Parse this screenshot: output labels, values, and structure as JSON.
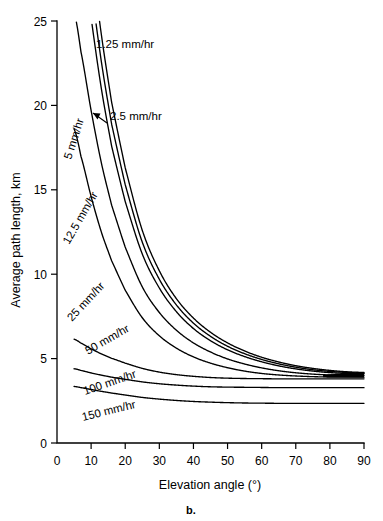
{
  "chart_data": {
    "type": "line",
    "title": "",
    "caption": "b.",
    "xlabel": "Elevation angle (°)",
    "ylabel": "Average path length, km",
    "xlim": [
      0,
      90
    ],
    "ylim": [
      0,
      25
    ],
    "xticks": [
      0,
      10,
      20,
      30,
      40,
      50,
      60,
      70,
      80,
      90
    ],
    "xticklabels": [
      "0",
      "10",
      "20",
      "30",
      "40",
      "50",
      "60",
      "70",
      "80",
      "90"
    ],
    "yticks": [
      0,
      5,
      10,
      15,
      20,
      25
    ],
    "yticklabels": [
      "0",
      "5",
      "10",
      "15",
      "20",
      "25"
    ],
    "grid": false,
    "legend_position": "inline-curve-labels",
    "x": [
      5,
      7,
      10,
      13,
      16,
      20,
      25,
      30,
      35,
      40,
      45,
      50,
      55,
      60,
      65,
      70,
      75,
      80,
      85,
      90
    ],
    "series": [
      {
        "name": "1.25 mm/hr",
        "label": "1.25 mm/hr",
        "label_rotation": 0,
        "values": [
          38.0,
          34.5,
          29.0,
          24.2,
          20.2,
          16.3,
          12.6,
          10.2,
          8.55,
          7.4,
          6.56,
          5.93,
          5.45,
          5.08,
          4.8,
          4.58,
          4.42,
          4.3,
          4.22,
          4.18
        ]
      },
      {
        "name": "2.5 mm/hr",
        "label": "2.5 mm/hr",
        "label_rotation": 0,
        "values": [
          35.5,
          32.2,
          27.1,
          22.6,
          18.9,
          15.3,
          11.9,
          9.7,
          8.18,
          7.1,
          6.32,
          5.73,
          5.29,
          4.95,
          4.69,
          4.49,
          4.34,
          4.24,
          4.18,
          4.14
        ]
      },
      {
        "name": "5 mm/hr",
        "label": "5 mm/hr",
        "label_rotation": -70,
        "values": [
          33.0,
          29.9,
          25.2,
          21.0,
          17.6,
          14.3,
          11.2,
          9.18,
          7.78,
          6.78,
          6.06,
          5.52,
          5.12,
          4.81,
          4.57,
          4.39,
          4.26,
          4.17,
          4.12,
          4.1
        ]
      },
      {
        "name": "12.5 mm/hr",
        "label": "12.5 mm/hr",
        "label_rotation": -58,
        "values": [
          25.5,
          23.2,
          19.7,
          16.6,
          14.1,
          11.6,
          9.25,
          7.73,
          6.68,
          5.93,
          5.39,
          4.98,
          4.68,
          4.45,
          4.28,
          4.16,
          4.08,
          4.03,
          4.01,
          4.0
        ]
      },
      {
        "name": "25 mm/hr",
        "label": "25 mm/hr",
        "label_rotation": -50,
        "values": [
          18.6,
          17.0,
          14.6,
          12.5,
          10.8,
          9.05,
          7.42,
          6.35,
          5.62,
          5.1,
          4.73,
          4.46,
          4.26,
          4.12,
          4.03,
          3.97,
          3.93,
          3.91,
          3.9,
          3.9
        ]
      },
      {
        "name": "50 mm/hr",
        "label": "50 mm/hr",
        "label_rotation": -32,
        "values": [
          6.15,
          5.92,
          5.58,
          5.28,
          5.02,
          4.73,
          4.42,
          4.2,
          4.05,
          3.95,
          3.88,
          3.84,
          3.82,
          3.81,
          3.8,
          3.8,
          3.8,
          3.8,
          3.8,
          3.8
        ]
      },
      {
        "name": "100 mm/hr",
        "label": "100 mm/hr",
        "label_rotation": -22,
        "values": [
          4.4,
          4.3,
          4.15,
          4.02,
          3.9,
          3.77,
          3.62,
          3.51,
          3.43,
          3.37,
          3.33,
          3.31,
          3.3,
          3.29,
          3.28,
          3.28,
          3.28,
          3.28,
          3.28,
          3.28
        ]
      },
      {
        "name": "150 mm/hr",
        "label": "150 mm/hr",
        "label_rotation": -18,
        "values": [
          3.35,
          3.28,
          3.17,
          3.06,
          2.96,
          2.84,
          2.7,
          2.6,
          2.52,
          2.46,
          2.42,
          2.39,
          2.37,
          2.36,
          2.35,
          2.35,
          2.35,
          2.35,
          2.35,
          2.35
        ]
      }
    ],
    "annotations": [
      {
        "text": "2.5 mm/hr",
        "kind": "leader-arrow",
        "target_x": 12,
        "target_y": 20.2
      }
    ]
  },
  "colors": {
    "background": "#ffffff",
    "ink": "#000000"
  }
}
